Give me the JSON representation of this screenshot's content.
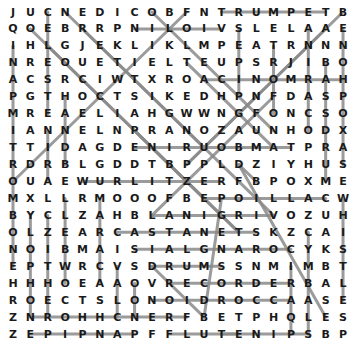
{
  "puzzle": {
    "type": "word-search",
    "rows": 20,
    "cols": 20,
    "grid": [
      "JUCNEDICOBFNTRUMPETB",
      "QOEBRRPNILOIVSLELAAE",
      "IHLGJEKLIKLMPEATRNNN",
      "NREOUETIELTEUPSRJIBO",
      "ACSRCIWTXROACINOMRAH",
      "PGTHOCTSIKEDHPNFDASP",
      "MREAELIAHGWWNGFONCSO",
      "IANNELNPRANOZAUNHODX",
      "TTIDAGDENIRUOBMATPRA",
      "RDRBLGDDTBPPLDZIYHUS",
      "OUAEWURLITZERFBPOXME",
      "MXLLRMOOOFBEPOILLACW",
      "BYCLZAHBLANIGRIVOZUH",
      "OLZEARCASTANETSKZCAI",
      "NOIBMAISIALGNAROCYKS",
      "EPTWRCVSDRUMSSNMIMBT",
      "HHHOEAAOVRECORDERBAL",
      "ROECTSLONOIDROCCAASE",
      "ZNROHHCNERFBETPHQLES",
      "ZEPIPNAPFFLUTENIPSBP"
    ],
    "found_lines": [
      {
        "word": "TRUMPET",
        "r1": 1,
        "c1": 13,
        "r2": 1,
        "c2": 19
      },
      {
        "word": "VIOLIN",
        "r1": 2,
        "c1": 13,
        "r2": 2,
        "c2": 8
      },
      {
        "word": "HARMONICA",
        "r1": 5,
        "c1": 20,
        "r2": 5,
        "c2": 12
      },
      {
        "word": "TAMBOURINE",
        "r1": 9,
        "c1": 17,
        "r2": 9,
        "c2": 8
      },
      {
        "word": "WURLITZER",
        "r1": 11,
        "c1": 5,
        "r2": 11,
        "c2": 13
      },
      {
        "word": "CALLIOPE",
        "r1": 12,
        "c1": 19,
        "r2": 12,
        "c2": 12
      },
      {
        "word": "VIRGINAL",
        "r1": 13,
        "c1": 16,
        "r2": 13,
        "c2": 9
      },
      {
        "word": "CASTANETS",
        "r1": 14,
        "c1": 7,
        "r2": 14,
        "c2": 15
      },
      {
        "word": "CORANGLAIS",
        "r1": 15,
        "c1": 17,
        "r2": 15,
        "c2": 8
      },
      {
        "word": "DRUMS",
        "r1": 16,
        "c1": 9,
        "r2": 16,
        "c2": 13
      },
      {
        "word": "RECORDER",
        "r1": 17,
        "c1": 10,
        "r2": 17,
        "c2": 17
      },
      {
        "word": "ACCORDION",
        "r1": 18,
        "c1": 17,
        "r2": 18,
        "c2": 9
      },
      {
        "word": "FRENCHHORN",
        "r1": 19,
        "c1": 11,
        "r2": 19,
        "c2": 2
      },
      {
        "word": "PANPIPE",
        "r1": 20,
        "c1": 8,
        "r2": 20,
        "c2": 2
      },
      {
        "word": "FLUTE",
        "r1": 20,
        "c1": 10,
        "r2": 20,
        "c2": 14
      },
      {
        "word": "SPINET",
        "r1": 20,
        "c1": 18,
        "r2": 20,
        "c2": 13
      },
      {
        "word": "SAXOPHONE",
        "r1": 10,
        "c1": 20,
        "r2": 2,
        "c2": 20
      },
      {
        "word": "WHISTLE",
        "r1": 12,
        "c1": 20,
        "r2": 18,
        "c2": 20
      },
      {
        "word": "OCARINA",
        "r1": 8,
        "c1": 18,
        "r2": 2,
        "c2": 18
      },
      {
        "word": "CYMBALS",
        "r1": 14,
        "c1": 18,
        "r2": 20,
        "c2": 18
      },
      {
        "word": "BASSOON",
        "r1": 4,
        "c1": 19,
        "r2": 11,
        "c2": 19
      },
      {
        "word": "TROMBONE",
        "r1": 9,
        "c1": 1,
        "r2": 16,
        "c2": 1
      },
      {
        "word": "TIMPANI",
        "r1": 9,
        "c1": 1,
        "r2": 3,
        "c2": 1
      },
      {
        "word": "CELESTA",
        "r1": 1,
        "c1": 3,
        "r2": 7,
        "c2": 3
      },
      {
        "word": "COL3B",
        "r1": 8,
        "c1": 3,
        "r2": 11,
        "c2": 3
      },
      {
        "word": "COL2",
        "r1": 13,
        "c1": 2,
        "r2": 19,
        "c2": 2
      },
      {
        "word": "COL3C",
        "r1": 13,
        "c1": 3,
        "r2": 19,
        "c2": 3
      },
      {
        "word": "COL4A",
        "r1": 6,
        "c1": 4,
        "r2": 10,
        "c2": 4
      },
      {
        "word": "COL4B",
        "r1": 12,
        "c1": 4,
        "r2": 17,
        "c2": 4
      },
      {
        "word": "COL7",
        "r1": 16,
        "c1": 7,
        "r2": 19,
        "c2": 7
      },
      {
        "word": "COL6",
        "r1": 12,
        "c1": 6,
        "r2": 17,
        "c2": 6
      },
      {
        "word": "COL8",
        "r1": 17,
        "c1": 8,
        "r2": 19,
        "c2": 8
      },
      {
        "word": "COL17",
        "r1": 16,
        "c1": 17,
        "r2": 20,
        "c2": 17
      },
      {
        "word": "COL14",
        "r1": 2,
        "c1": 14,
        "r2": 6,
        "c2": 14
      },
      {
        "word": "COL12",
        "r1": 3,
        "c1": 16,
        "r2": 7,
        "c2": 16
      },
      {
        "word": "DIAG1",
        "r1": 1,
        "c1": 4,
        "r2": 13,
        "c2": 16
      },
      {
        "word": "DIAG2",
        "r1": 2,
        "c1": 2,
        "r2": 14,
        "c2": 14
      },
      {
        "word": "DIAG3",
        "r1": 3,
        "c1": 3,
        "r2": 12,
        "c2": 12
      },
      {
        "word": "DIAG4",
        "r1": 2,
        "c1": 5,
        "r2": 9,
        "c2": 12
      },
      {
        "word": "DIAG5",
        "r1": 1,
        "c1": 9,
        "r2": 8,
        "c2": 16
      },
      {
        "word": "DIAG6",
        "r1": 10,
        "c1": 14,
        "r2": 11,
        "c2": 15
      },
      {
        "word": "DIAG7",
        "r1": 10,
        "c1": 14,
        "r2": 19,
        "c2": 19
      },
      {
        "word": "DIAG8",
        "r1": 12,
        "c1": 13,
        "r2": 19,
        "c2": 12
      },
      {
        "word": "DIAG9",
        "r1": 11,
        "c1": 1,
        "r2": 1,
        "c2": 11
      },
      {
        "word": "DIAG10",
        "r1": 1,
        "c1": 20,
        "r2": 10,
        "c2": 11
      },
      {
        "word": "DIAG11",
        "r1": 2,
        "c1": 19,
        "r2": 10,
        "c2": 11
      },
      {
        "word": "DIAG12",
        "r1": 6,
        "c1": 16,
        "r2": 13,
        "c2": 9
      },
      {
        "word": "DIAG13",
        "r1": 8,
        "c1": 8,
        "r2": 14,
        "c2": 14
      },
      {
        "word": "DIAG14",
        "r1": 16,
        "c1": 9,
        "r2": 19,
        "c2": 12
      },
      {
        "word": "DIAG15",
        "r1": 4,
        "c1": 11,
        "r2": 9,
        "c2": 16
      }
    ],
    "line_color": "#8a8a8a"
  }
}
